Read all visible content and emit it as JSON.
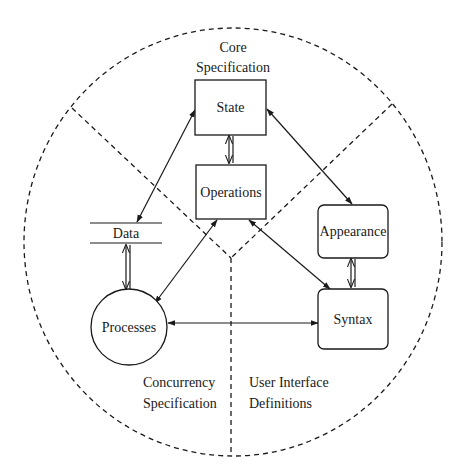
{
  "diagram": {
    "regions": {
      "core": {
        "line1": "Core",
        "line2": "Specification"
      },
      "concurrency": {
        "line1": "Concurrency",
        "line2": "Specification"
      },
      "user_interface": {
        "line1": "User Interface",
        "line2": "Definitions"
      }
    },
    "nodes": {
      "state": {
        "label": "State",
        "shape": "rectangle"
      },
      "operations": {
        "label": "Operations",
        "shape": "rectangle"
      },
      "data": {
        "label": "Data",
        "shape": "data-store"
      },
      "processes": {
        "label": "Processes",
        "shape": "circle"
      },
      "appearance": {
        "label": "Appearance",
        "shape": "rounded-rectangle"
      },
      "syntax": {
        "label": "Syntax",
        "shape": "rounded-rectangle"
      }
    },
    "edges": [
      {
        "from": "state",
        "to": "operations",
        "type": "bidirectional"
      },
      {
        "from": "state",
        "to": "data",
        "type": "bidirectional"
      },
      {
        "from": "state",
        "to": "appearance",
        "type": "bidirectional"
      },
      {
        "from": "data",
        "to": "processes",
        "type": "bidirectional"
      },
      {
        "from": "operations",
        "to": "processes",
        "type": "bidirectional"
      },
      {
        "from": "operations",
        "to": "syntax",
        "type": "bidirectional"
      },
      {
        "from": "appearance",
        "to": "syntax",
        "type": "bidirectional"
      },
      {
        "from": "processes",
        "to": "syntax",
        "type": "bidirectional"
      }
    ],
    "colors": {
      "ink": "#1a1a1a",
      "background": "#ffffff"
    }
  }
}
